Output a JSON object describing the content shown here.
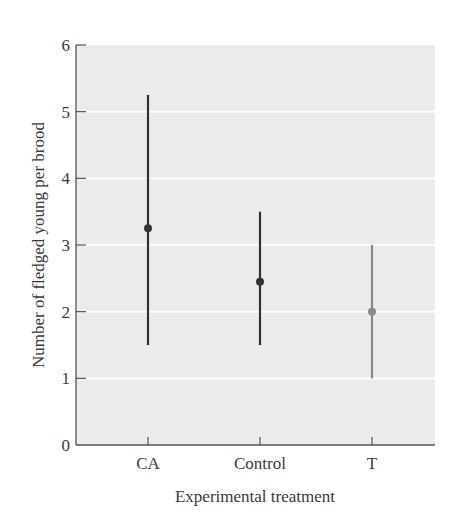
{
  "chart_data": {
    "type": "scatter",
    "subtype": "error-bar",
    "title": "",
    "xlabel": "Experimental treatment",
    "ylabel": "Number of fledged young per brood",
    "ylim": [
      0,
      6
    ],
    "yticks": [
      "0",
      "1",
      "2",
      "3",
      "4",
      "5",
      "6"
    ],
    "categories": [
      "CA",
      "Control",
      "T"
    ],
    "series": [
      {
        "name": "Mean with range",
        "mean": [
          3.25,
          2.45,
          2.0
        ],
        "upper": [
          5.25,
          3.5,
          3.0
        ],
        "lower": [
          1.5,
          1.5,
          1.0
        ],
        "colors": [
          "#333333",
          "#333333",
          "#8a8a8a"
        ]
      }
    ],
    "grid": true,
    "plot_background": "#ececec",
    "gridline_color": "#ffffff",
    "legend": null
  }
}
